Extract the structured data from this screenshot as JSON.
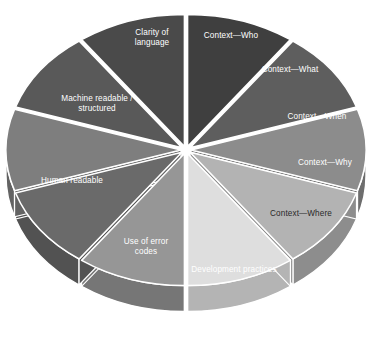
{
  "chart_data": {
    "type": "pie",
    "title": "",
    "subtitle": "",
    "xlabel": "",
    "ylabel": "",
    "legend_position": "none",
    "grid": false,
    "style": "3d-exploded-pie",
    "categories": [
      "Context—Who",
      "Context—What",
      "Context—When",
      "Context—Why",
      "Context—Where",
      "Development practices",
      "Use of error codes",
      "Human readable",
      "Machine readable /\nstructured",
      "Clarity of\nlanguage"
    ],
    "values": [
      10,
      10,
      10,
      10,
      10,
      10,
      10,
      10,
      10,
      10
    ],
    "units": "percent",
    "slices": [
      {
        "label": "Context—Who",
        "value": 10,
        "color": "#3f3f3f",
        "side_color": "#303030",
        "label_color": "#ffffff",
        "start_angle": 0,
        "end_angle": 36,
        "label_x": 231,
        "label_y": 36
      },
      {
        "label": "Context—What",
        "value": 10,
        "color": "#5e5e5e",
        "side_color": "#474747",
        "label_color": "#ffffff",
        "start_angle": 36,
        "end_angle": 72,
        "label_x": 290,
        "label_y": 70
      },
      {
        "label": "Context—When",
        "value": 10,
        "color": "#8c8c8c",
        "side_color": "#6d6d6d",
        "label_color": "#ffffff",
        "start_angle": 72,
        "end_angle": 108,
        "label_x": 317,
        "label_y": 117
      },
      {
        "label": "Context—Why",
        "value": 10,
        "color": "#b3b3b3",
        "side_color": "#8d8d8d",
        "label_color": "#ffffff",
        "start_angle": 108,
        "end_angle": 144,
        "label_x": 325,
        "label_y": 163
      },
      {
        "label": "Context—Where",
        "value": 10,
        "color": "#dedede",
        "side_color": "#b4b4b4",
        "label_color": "#2a2a2a",
        "start_angle": 144,
        "end_angle": 180,
        "label_x": 301,
        "label_y": 214
      },
      {
        "label": "Development practices",
        "value": 10,
        "color": "#969696",
        "side_color": "#767676",
        "label_color": "#ffffff",
        "start_angle": 180,
        "end_angle": 216,
        "label_x": 234,
        "label_y": 270
      },
      {
        "label": "Use of error\ncodes",
        "value": 10,
        "color": "#6a6a6a",
        "side_color": "#525252",
        "label_color": "#ffffff",
        "start_angle": 216,
        "end_angle": 252,
        "label_x": 146,
        "label_y": 247
      },
      {
        "label": "Human readable",
        "value": 10,
        "color": "#7e7e7e",
        "side_color": "#636363",
        "label_color": "#ffffff",
        "start_angle": 252,
        "end_angle": 288,
        "label_x": 72,
        "label_y": 181
      },
      {
        "label": "Machine readable /\nstructured",
        "value": 10,
        "color": "#595959",
        "side_color": "#444444",
        "label_color": "#ffffff",
        "start_angle": 288,
        "end_angle": 324,
        "label_x": 97,
        "label_y": 104
      },
      {
        "label": "Clarity of\nlanguage",
        "value": 10,
        "color": "#4a4a4a",
        "side_color": "#383838",
        "label_color": "#ffffff",
        "start_angle": 324,
        "end_angle": 360,
        "label_x": 152,
        "label_y": 38
      }
    ],
    "geometry": {
      "center_x": 186,
      "center_y": 150,
      "radius_x": 175,
      "radius_y": 132,
      "depth": 26,
      "explode": 5,
      "gap_color": "#ffffff"
    }
  }
}
